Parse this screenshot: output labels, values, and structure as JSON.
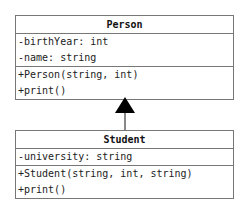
{
  "classes": {
    "person": {
      "name": "Person",
      "attributes": [
        "-birthYear: int",
        "-name: string"
      ],
      "methods": [
        "+Person(string, int)",
        "+print()"
      ]
    },
    "student": {
      "name": "Student",
      "attributes": [
        "-university: string"
      ],
      "methods": [
        "+Student(string, int, string)",
        "+print()"
      ]
    }
  },
  "relationship": {
    "type": "inheritance",
    "from": "Student",
    "to": "Person",
    "arrow_color": "#000000",
    "line_color": "#888888"
  }
}
